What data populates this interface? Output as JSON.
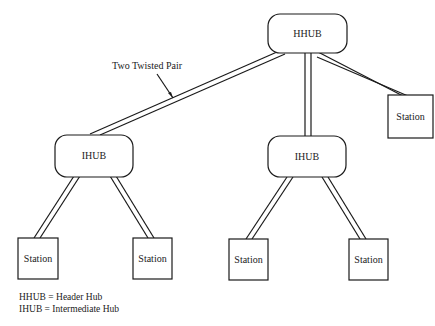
{
  "diagram": {
    "type": "hierarchical network topology",
    "nodes": {
      "hhub": {
        "label": "HHUB"
      },
      "ihub_left": {
        "label": "IHUB"
      },
      "ihub_right": {
        "label": "IHUB"
      },
      "station_top_right": {
        "label": "Station"
      },
      "station_1": {
        "label": "Station"
      },
      "station_2": {
        "label": "Station"
      },
      "station_3": {
        "label": "Station"
      },
      "station_4": {
        "label": "Station"
      }
    },
    "edges": [
      {
        "from": "HHUB",
        "to": "IHUB (left)"
      },
      {
        "from": "HHUB",
        "to": "IHUB (right)"
      },
      {
        "from": "HHUB",
        "to": "Station (top right)"
      },
      {
        "from": "IHUB (left)",
        "to": "Station 1"
      },
      {
        "from": "IHUB (left)",
        "to": "Station 2"
      },
      {
        "from": "IHUB (right)",
        "to": "Station 3"
      },
      {
        "from": "IHUB (right)",
        "to": "Station 4"
      }
    ],
    "callout": {
      "label": "Two Twisted Pair"
    }
  },
  "legend": {
    "line1": "HHUB = Header Hub",
    "line2": "IHUB = Intermediate Hub"
  },
  "colors": {
    "stroke": "#1a1a1a",
    "background": "#ffffff"
  }
}
